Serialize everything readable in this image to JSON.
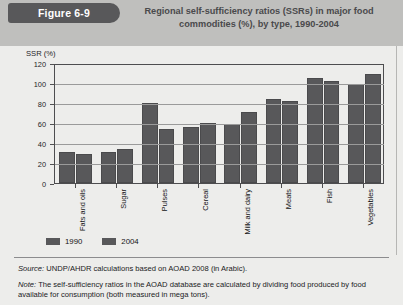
{
  "figure": {
    "tab_label": "Figure 6-9",
    "title": "Regional self-sufficiency ratios (SSRs) in major food commodities (%), by type, 1990-2004"
  },
  "footer": {
    "source_label": "Source:",
    "source_text": " UNDP/AHDR calculations based on AOAD 2008 (in Arabic).",
    "note_label": "Note:",
    "note_text": " The self-sufficiency ratios in the AOAD database are calculated by dividing food produced by food available for consumption (both measured in mega tons)."
  },
  "colors": {
    "bar": "#58585a",
    "header_band": "#bfbfbd",
    "panel": "#ededeb",
    "tab": "#58585a"
  },
  "chart_data": {
    "type": "bar",
    "title": "Regional self-sufficiency ratios (SSRs) in major food commodities (%), by type, 1990-2004",
    "xlabel": "",
    "ylabel": "SSR (%)",
    "ylim": [
      0,
      120
    ],
    "yticks": [
      0,
      20,
      40,
      60,
      80,
      100,
      120
    ],
    "ytick_labels": [
      "0",
      "20",
      "40",
      "60",
      "80",
      "100",
      "120"
    ],
    "grid": true,
    "legend_position": "bottom-left",
    "categories": [
      "Fats and oils",
      "Sugar",
      "Pulses",
      "Cereal",
      "Milk and dairy",
      "Meats",
      "Fish",
      "Vegetables"
    ],
    "series": [
      {
        "name": "1990",
        "values": [
          31,
          31,
          80,
          56,
          59,
          84,
          105,
          99
        ]
      },
      {
        "name": "2004",
        "values": [
          29,
          34,
          54,
          60,
          71,
          82,
          102,
          109
        ]
      }
    ]
  }
}
